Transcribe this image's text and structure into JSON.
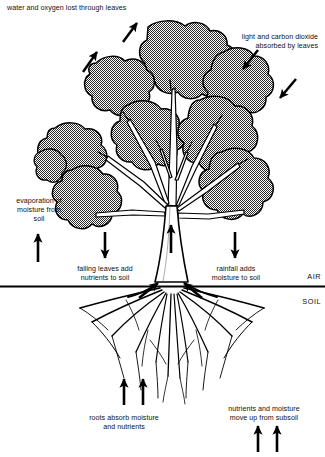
{
  "diagram": {
    "ground_line_label_air": "AIR",
    "ground_line_label_soil": "SOIL",
    "labels": {
      "top_left": "water and oxygen lost through leaves",
      "top_right_line1": "light and carbon dioxide",
      "top_right_line2": "absorbed by leaves",
      "left_mid_line1": "evaporation of",
      "left_mid_line2": "moisture from",
      "left_mid_line3": "soil",
      "center_left_line1": "falling leaves add",
      "center_left_line2": "nutrients to soil",
      "center_right_line1": "rainfall adds",
      "center_right_line2": "moisture to soil",
      "bottom_left_line1": "roots absorb moisture",
      "bottom_left_line2": "and nutrients",
      "bottom_right_line1": "nutrients and moisture",
      "bottom_right_line2": "move up from subsoil"
    },
    "colors": {
      "canopy_fill": "#7c7c7c",
      "outline": "#000000",
      "background": "#ffffff",
      "text": "#111111"
    },
    "arrows": [
      {
        "name": "water-oxygen-out-left",
        "direction": "up-right",
        "count": 1
      },
      {
        "name": "water-oxygen-out-mid",
        "direction": "up-right",
        "count": 1
      },
      {
        "name": "light-co2-in-upper",
        "direction": "down-left",
        "count": 1
      },
      {
        "name": "light-co2-in-lower",
        "direction": "down-left",
        "count": 1
      },
      {
        "name": "evaporation-up",
        "direction": "up",
        "count": 1
      },
      {
        "name": "falling-leaves-down",
        "direction": "down",
        "count": 1
      },
      {
        "name": "rainfall-down",
        "direction": "down",
        "count": 1
      },
      {
        "name": "trunk-transport-up",
        "direction": "up",
        "count": 1
      },
      {
        "name": "root-uptake-inward",
        "direction": "inward",
        "count": 2
      },
      {
        "name": "roots-absorb-up",
        "direction": "up",
        "count": 2
      },
      {
        "name": "subsoil-up",
        "direction": "up",
        "count": 2
      }
    ]
  }
}
